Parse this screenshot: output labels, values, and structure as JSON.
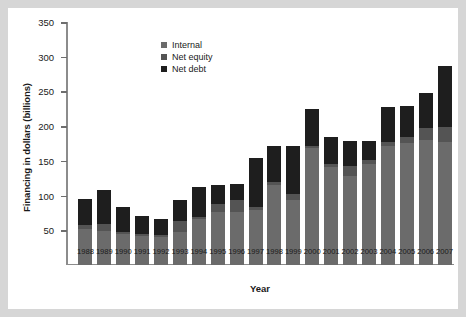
{
  "chart_data": {
    "type": "bar",
    "stacked": true,
    "title": "",
    "xlabel": "Year",
    "ylabel": "Financing in dollars (billions)",
    "ylim": [
      0,
      350
    ],
    "yticks": [
      50,
      100,
      150,
      200,
      250,
      300,
      350
    ],
    "grid": false,
    "legend_position": "top-center-left",
    "categories": [
      "1988",
      "1989",
      "1990",
      "1991",
      "1992",
      "1993",
      "1994",
      "1995",
      "1996",
      "1997",
      "1998",
      "1999",
      "2000",
      "2001",
      "2002",
      "2003",
      "2004",
      "2005",
      "2006",
      "2007"
    ],
    "series": [
      {
        "name": "Internal",
        "color": "#6b6b6b",
        "values": [
          52,
          49,
          45,
          42,
          41,
          47,
          66,
          77,
          76,
          79,
          115,
          94,
          168,
          141,
          128,
          146,
          172,
          176,
          180,
          177
        ]
      },
      {
        "name": "Net equity",
        "color": "#545454",
        "values": [
          5,
          10,
          3,
          2,
          2,
          16,
          3,
          11,
          18,
          5,
          5,
          8,
          4,
          4,
          14,
          5,
          5,
          8,
          18,
          22
        ]
      },
      {
        "name": "Net debt",
        "color": "#1e1e1e",
        "values": [
          38,
          49,
          35,
          26,
          24,
          31,
          43,
          27,
          23,
          70,
          52,
          69,
          53,
          40,
          36,
          28,
          51,
          45,
          50,
          87
        ]
      }
    ],
    "totals": [
      95,
      108,
      83,
      70,
      67,
      94,
      112,
      115,
      117,
      154,
      172,
      171,
      225,
      185,
      178,
      179,
      228,
      229,
      248,
      286
    ]
  },
  "legend": {
    "items": [
      {
        "label": "Internal"
      },
      {
        "label": "Net equity"
      },
      {
        "label": "Net debt"
      }
    ]
  }
}
